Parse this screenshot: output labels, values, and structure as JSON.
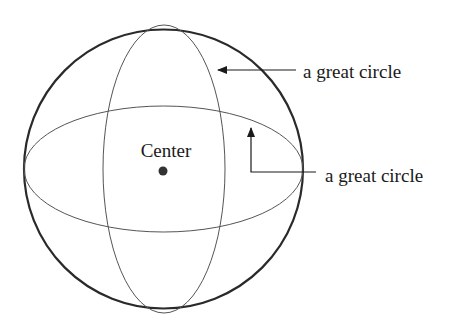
{
  "diagram": {
    "center_label": "Center",
    "annotations": [
      {
        "label": "a great circle",
        "target": "vertical ellipse"
      },
      {
        "label": "a great circle",
        "target": "horizontal ellipse"
      }
    ],
    "colors": {
      "stroke": "#333333",
      "background": "#ffffff"
    }
  }
}
